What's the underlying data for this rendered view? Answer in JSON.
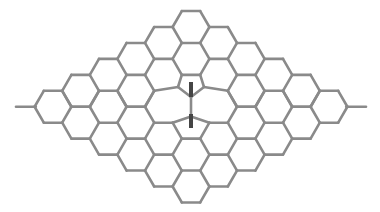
{
  "diagram": {
    "type": "graphene-lattice-stone-wales-defect",
    "background": "#ffffff",
    "bond_color": "#8a8a8a",
    "marker_color": "#454545",
    "lattice": {
      "shape": "rhombus",
      "rows": 6,
      "cols": 6,
      "hex_side": 18.4,
      "top_hex_center": [
        191,
        27
      ],
      "col_dx": 27.6,
      "half_row_dy": 15.95
    },
    "end_stubs": [
      {
        "from": [
          16,
          106.8
        ],
        "to": [
          35.8,
          106.8
        ]
      },
      {
        "from": [
          346.2,
          106.8
        ],
        "to": [
          366,
          106.8
        ]
      }
    ],
    "defect": {
      "name": "rotated-bond",
      "central_bond": {
        "from": [
          191,
          97
        ],
        "to": [
          191,
          116.5
        ]
      },
      "moved_vertices": [
        {
          "orig": [
            172.6,
            90.85
          ],
          "new": [
            178,
            87
          ]
        },
        {
          "orig": [
            209.4,
            90.85
          ],
          "new": [
            204,
            87
          ]
        },
        {
          "orig": [
            172.6,
            122.75
          ],
          "new": [
            178,
            126.5
          ]
        },
        {
          "orig": [
            209.4,
            122.75
          ],
          "new": [
            204,
            126.5
          ]
        }
      ],
      "merged_top": {
        "orig": [
          [
            181.8,
            106.8
          ],
          [
            200.2,
            106.8
          ]
        ],
        "new": [
          191,
          97
        ]
      },
      "merged_bottom": {
        "orig": [
          [
            181.8,
            106.8
          ],
          [
            200.2,
            106.8
          ]
        ],
        "new": [
          191,
          116.5
        ]
      },
      "markers": [
        {
          "name": "upper-displacement-marker",
          "from": [
            191,
            82
          ],
          "to": [
            191,
            97
          ]
        },
        {
          "name": "lower-displacement-marker",
          "from": [
            191,
            114
          ],
          "to": [
            191,
            128
          ]
        }
      ]
    }
  }
}
